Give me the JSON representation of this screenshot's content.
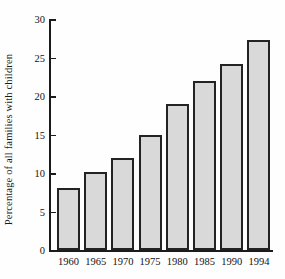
{
  "chart_data": {
    "type": "bar",
    "title": "",
    "subtitle": "",
    "xlabel": "",
    "ylabel": "Percentage of all families with children",
    "categories": [
      "1960",
      "1965",
      "1970",
      "1975",
      "1980",
      "1985",
      "1990",
      "1994"
    ],
    "values": [
      8.0,
      10.1,
      12.0,
      15.0,
      19.0,
      22.0,
      24.2,
      27.3
    ],
    "series": [
      {
        "name": "Percentage of all families with children",
        "values": [
          8.0,
          10.1,
          12.0,
          15.0,
          19.0,
          22.0,
          24.2,
          27.3
        ]
      }
    ],
    "ylim": [
      0,
      30
    ],
    "yticks": [
      0,
      5,
      10,
      15,
      20,
      25,
      30
    ],
    "ytick_labels": [
      "0",
      "5",
      "10",
      "15",
      "20",
      "25",
      "30"
    ],
    "xtick_labels": [
      "1960",
      "1965",
      "1970",
      "1975",
      "1980",
      "1985",
      "1990",
      "1994"
    ],
    "grid": false,
    "legend": false,
    "legend_position": "none",
    "annotations": [],
    "colors": {
      "bar_fill": "#d9d9d9",
      "bar_edge": "#232323",
      "axis": "#1b1b1b",
      "text": "#121212",
      "background": "#fefefe"
    }
  }
}
